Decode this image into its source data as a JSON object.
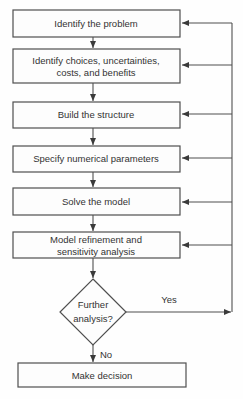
{
  "diagram": {
    "type": "flowchart",
    "background_color": "#fefefe",
    "line_color": "#4f4f4f",
    "text_color": "#333333",
    "nodes": {
      "identify_problem": {
        "shape": "rect",
        "label": "Identify the problem"
      },
      "identify_choices": {
        "shape": "rect",
        "line1": "Identify choices, uncertainties,",
        "line2": "costs, and benefits"
      },
      "build_structure": {
        "shape": "rect",
        "label": "Build the structure"
      },
      "specify_parameters": {
        "shape": "rect",
        "label": "Specify numerical parameters"
      },
      "solve_model": {
        "shape": "rect",
        "label": "Solve the model"
      },
      "model_refinement": {
        "shape": "rect",
        "line1": "Model refinement and",
        "line2": "sensitivity analysis"
      },
      "further_analysis": {
        "shape": "diamond",
        "line1": "Further",
        "line2": "analysis?"
      },
      "make_decision": {
        "shape": "rect",
        "label": "Make decision"
      }
    },
    "edge_labels": {
      "yes": "Yes",
      "no": "No"
    },
    "edges": [
      {
        "from": "identify_problem",
        "to": "identify_choices"
      },
      {
        "from": "identify_choices",
        "to": "build_structure"
      },
      {
        "from": "build_structure",
        "to": "specify_parameters"
      },
      {
        "from": "specify_parameters",
        "to": "solve_model"
      },
      {
        "from": "solve_model",
        "to": "model_refinement"
      },
      {
        "from": "model_refinement",
        "to": "further_analysis"
      },
      {
        "from": "further_analysis",
        "to": "make_decision",
        "label": "No"
      },
      {
        "from": "further_analysis",
        "to": "feedback_loop",
        "label": "Yes"
      },
      {
        "from": "feedback_loop",
        "to": "identify_problem"
      },
      {
        "from": "feedback_loop",
        "to": "identify_choices"
      },
      {
        "from": "feedback_loop",
        "to": "build_structure"
      },
      {
        "from": "feedback_loop",
        "to": "specify_parameters"
      },
      {
        "from": "feedback_loop",
        "to": "solve_model"
      },
      {
        "from": "feedback_loop",
        "to": "model_refinement"
      }
    ]
  }
}
